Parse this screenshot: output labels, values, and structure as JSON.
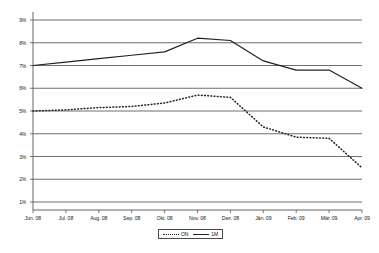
{
  "chart_data": {
    "type": "line",
    "title": "",
    "xlabel": "",
    "ylabel": "",
    "grid": true,
    "legend_position": "bottom-center",
    "ylim": [
      1,
      9
    ],
    "ytick_labels": [
      "9%",
      "8%",
      "7%",
      "6%",
      "5%",
      "4%",
      "3%",
      "2%",
      "1%"
    ],
    "ytick_values": [
      9,
      8,
      7,
      6,
      5,
      4,
      3,
      2,
      1
    ],
    "categories": [
      "Jun. 08",
      "Jul. 08",
      "Aug. 08",
      "Sep. 08",
      "Okt. 08",
      "Nov. 08",
      "Dez. 08",
      "Jän. 09",
      "Feb. 09",
      "Mär. 09",
      "Apr. 09"
    ],
    "series": [
      {
        "name": "ON",
        "style": "dotted",
        "color": "#222222",
        "values": [
          5.0,
          5.05,
          5.15,
          5.2,
          5.35,
          5.7,
          5.6,
          4.3,
          3.85,
          3.8,
          2.5
        ]
      },
      {
        "name": "1M",
        "style": "solid",
        "color": "#222222",
        "values": [
          7.0,
          7.15,
          7.3,
          7.45,
          7.6,
          8.2,
          8.1,
          7.2,
          6.8,
          6.8,
          6.0
        ]
      }
    ]
  },
  "legend": {
    "entries": [
      {
        "label": "ON",
        "style": "dotted"
      },
      {
        "label": "1M",
        "style": "solid"
      }
    ]
  },
  "colors": {
    "axis": "#555555",
    "grid": "#4a4a4a",
    "series_line": "#222222",
    "text": "#1a1a1a",
    "background": "#ffffff"
  }
}
